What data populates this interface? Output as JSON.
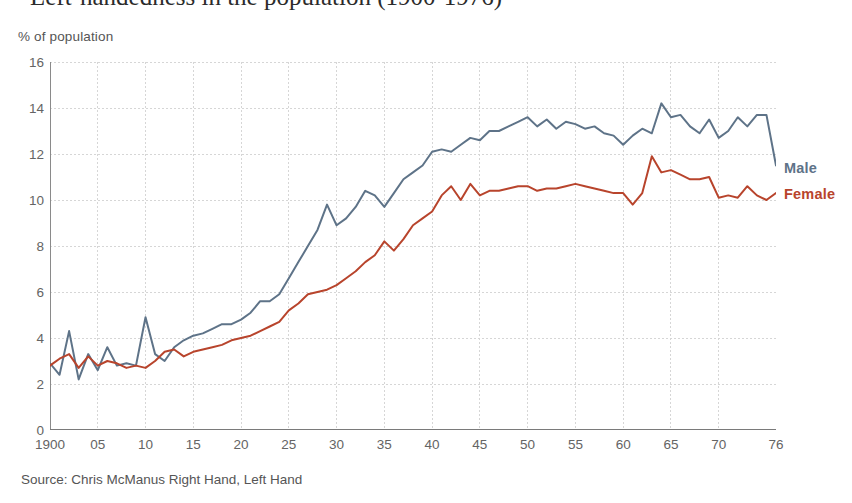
{
  "headline": "Left-handedness in the population (1900-1976)",
  "y_axis_caption": "% of population",
  "source_note": "Source: Chris McManus Right Hand, Left Hand",
  "labels": {
    "male": "Male",
    "female": "Female"
  },
  "colors": {
    "male": "#5e7388",
    "female": "#b8442c",
    "grid": "#d6d6d6",
    "axis": "#8a8a8a",
    "tick_text": "#646464"
  },
  "chart_data": {
    "type": "line",
    "title": "Left-handedness in the population (1900-1976)",
    "xlabel": "",
    "ylabel": "% of population",
    "xlim": [
      1900,
      1976
    ],
    "ylim": [
      0,
      16
    ],
    "yticks": [
      0,
      2,
      4,
      6,
      8,
      10,
      12,
      14,
      16
    ],
    "ytick_labels": [
      "0",
      "2",
      "4",
      "6",
      "8",
      "10",
      "12",
      "14",
      "16"
    ],
    "xticks": [
      1900,
      1905,
      1910,
      1915,
      1920,
      1925,
      1930,
      1935,
      1940,
      1945,
      1950,
      1955,
      1960,
      1965,
      1970,
      1976
    ],
    "xtick_labels": [
      "1900",
      "05",
      "10",
      "15",
      "20",
      "25",
      "30",
      "35",
      "40",
      "45",
      "50",
      "55",
      "60",
      "65",
      "70",
      "76"
    ],
    "grid": true,
    "legend": "end-of-line labels",
    "x": [
      1900,
      1901,
      1902,
      1903,
      1904,
      1905,
      1906,
      1907,
      1908,
      1909,
      1910,
      1911,
      1912,
      1913,
      1914,
      1915,
      1916,
      1917,
      1918,
      1919,
      1920,
      1921,
      1922,
      1923,
      1924,
      1925,
      1926,
      1927,
      1928,
      1929,
      1930,
      1931,
      1932,
      1933,
      1934,
      1935,
      1936,
      1937,
      1938,
      1939,
      1940,
      1941,
      1942,
      1943,
      1944,
      1945,
      1946,
      1947,
      1948,
      1949,
      1950,
      1951,
      1952,
      1953,
      1954,
      1955,
      1956,
      1957,
      1958,
      1959,
      1960,
      1961,
      1962,
      1963,
      1964,
      1965,
      1966,
      1967,
      1968,
      1969,
      1970,
      1971,
      1972,
      1973,
      1974,
      1975,
      1976
    ],
    "series": [
      {
        "name": "Male",
        "color": "#5e7388",
        "values": [
          2.9,
          2.4,
          4.3,
          2.2,
          3.3,
          2.6,
          3.6,
          2.8,
          2.9,
          2.8,
          4.9,
          3.3,
          3.0,
          3.6,
          3.9,
          4.1,
          4.2,
          4.4,
          4.6,
          4.6,
          4.8,
          5.1,
          5.6,
          5.6,
          5.9,
          6.6,
          7.3,
          8.0,
          8.7,
          9.8,
          8.9,
          9.2,
          9.7,
          10.4,
          10.2,
          9.7,
          10.3,
          10.9,
          11.2,
          11.5,
          12.1,
          12.2,
          12.1,
          12.4,
          12.7,
          12.6,
          13.0,
          13.0,
          13.2,
          13.4,
          13.6,
          13.2,
          13.5,
          13.1,
          13.4,
          13.3,
          13.1,
          13.2,
          12.9,
          12.8,
          12.4,
          12.8,
          13.1,
          12.9,
          14.2,
          13.6,
          13.7,
          13.2,
          12.9,
          13.5,
          12.7,
          13.0,
          13.6,
          13.2,
          13.7,
          13.7,
          11.5
        ]
      },
      {
        "name": "Female",
        "color": "#b8442c",
        "values": [
          2.8,
          3.1,
          3.3,
          2.7,
          3.2,
          2.8,
          3.0,
          2.9,
          2.7,
          2.8,
          2.7,
          3.0,
          3.4,
          3.5,
          3.2,
          3.4,
          3.5,
          3.6,
          3.7,
          3.9,
          4.0,
          4.1,
          4.3,
          4.5,
          4.7,
          5.2,
          5.5,
          5.9,
          6.0,
          6.1,
          6.3,
          6.6,
          6.9,
          7.3,
          7.6,
          8.2,
          7.8,
          8.3,
          8.9,
          9.2,
          9.5,
          10.2,
          10.6,
          10.0,
          10.7,
          10.2,
          10.4,
          10.4,
          10.5,
          10.6,
          10.6,
          10.4,
          10.5,
          10.5,
          10.6,
          10.7,
          10.6,
          10.5,
          10.4,
          10.3,
          10.3,
          9.8,
          10.3,
          11.9,
          11.2,
          11.3,
          11.1,
          10.9,
          10.9,
          11.0,
          10.1,
          10.2,
          10.1,
          10.6,
          10.2,
          10.0,
          10.3
        ]
      }
    ]
  }
}
